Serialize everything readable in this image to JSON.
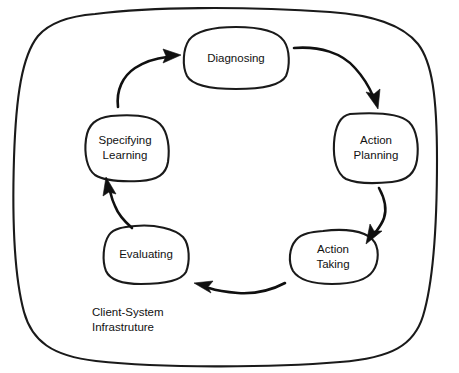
{
  "diagram": {
    "type": "cycle-diagram",
    "canvas": {
      "width": 459,
      "height": 373
    },
    "style": {
      "background_color": "#ffffff",
      "stroke_color": "#1a1a1a",
      "arrow_color": "#101010",
      "text_color": "#111111",
      "hand_drawn": true
    },
    "boundary": {
      "label_line_1": "Client-System",
      "label_line_2": "Infrastruture",
      "shape": "rounded-blob-rectangle"
    },
    "nodes": [
      {
        "id": "diagnosing",
        "label_line_1": "Diagnosing",
        "label_line_2": "",
        "shape": "rounded-blob",
        "position": "top"
      },
      {
        "id": "action-planning",
        "label_line_1": "Action",
        "label_line_2": "Planning",
        "shape": "rounded-blob",
        "position": "right-upper"
      },
      {
        "id": "action-taking",
        "label_line_1": "Action",
        "label_line_2": "Taking",
        "shape": "rounded-blob",
        "position": "right-lower"
      },
      {
        "id": "evaluating",
        "label_line_1": "Evaluating",
        "label_line_2": "",
        "shape": "rounded-blob",
        "position": "left-lower"
      },
      {
        "id": "specifying-learning",
        "label_line_1": "Specifying",
        "label_line_2": "Learning",
        "shape": "rounded-blob",
        "position": "left-upper"
      }
    ],
    "arrows": [
      {
        "id": "arrow-diagnosing-to-action-planning",
        "from": "diagnosing",
        "to": "action-planning",
        "direction": "clockwise"
      },
      {
        "id": "arrow-action-planning-to-action-taking",
        "from": "action-planning",
        "to": "action-taking",
        "direction": "clockwise"
      },
      {
        "id": "arrow-action-taking-to-evaluating",
        "from": "action-taking",
        "to": "evaluating",
        "direction": "clockwise"
      },
      {
        "id": "arrow-evaluating-to-specifying-learning",
        "from": "evaluating",
        "to": "specifying-learning",
        "direction": "clockwise"
      },
      {
        "id": "arrow-specifying-learning-to-diagnosing",
        "from": "specifying-learning",
        "to": "diagnosing",
        "direction": "clockwise"
      }
    ]
  }
}
